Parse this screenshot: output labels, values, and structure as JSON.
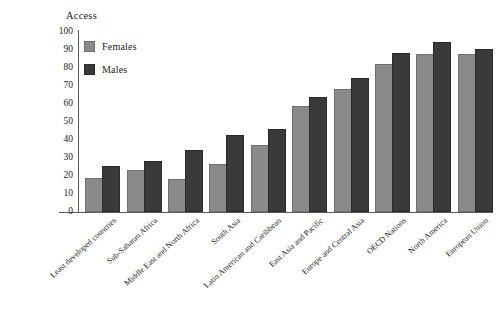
{
  "chart_data": {
    "type": "bar",
    "title": "",
    "ylabel": "Access",
    "xlabel": "",
    "ylim": [
      0,
      100
    ],
    "yticks": [
      0,
      10,
      20,
      30,
      40,
      50,
      60,
      70,
      80,
      90,
      100
    ],
    "grid": false,
    "legend_position": "top-left",
    "categories": [
      "Least developed countries",
      "Sub-Saharan Africa",
      "Middle East and North Africa",
      "South Asia",
      "Latin American and Caribbean",
      "East Asia and Pacific",
      "Europe and Central Asia",
      "OECD Nations",
      "North America",
      "European Union"
    ],
    "series": [
      {
        "name": "Females",
        "color": "#8a8a8a",
        "values": [
          18,
          22,
          17.5,
          25.5,
          36,
          58,
          67.5,
          81,
          86.5,
          86.5
        ]
      },
      {
        "name": "Males",
        "color": "#3a3a3a",
        "values": [
          24.5,
          27,
          33.5,
          41.5,
          45,
          63,
          73.5,
          87,
          93.5,
          89.5
        ]
      }
    ]
  },
  "colors": {
    "females": "#8a8a8a",
    "males": "#3a3a3a",
    "axis": "#5a5a5a",
    "background": "#ffffff"
  }
}
